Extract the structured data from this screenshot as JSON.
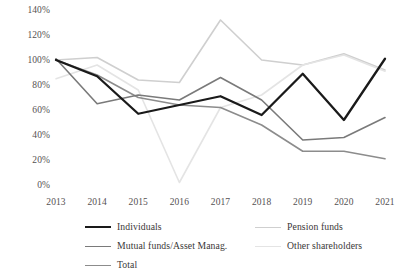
{
  "chart_data": {
    "type": "line",
    "title": "",
    "subtitle": "",
    "xlabel": "",
    "ylabel": "",
    "categories": [
      "2013",
      "2014",
      "2015",
      "2016",
      "2017",
      "2018",
      "2019",
      "2020",
      "2021"
    ],
    "ylim": [
      0,
      140
    ],
    "ytick_values": [
      0,
      20,
      40,
      60,
      80,
      100,
      120,
      140
    ],
    "ytick_labels": [
      "0%",
      "20%",
      "40%",
      "60%",
      "80%",
      "100%",
      "120%",
      "140%"
    ],
    "grid": false,
    "legend_position": "bottom",
    "series": [
      {
        "name": "Individuals",
        "color": "#1a1a1a",
        "width": 2.3,
        "values": [
          100,
          87,
          57,
          64,
          71,
          56,
          89,
          52,
          101
        ]
      },
      {
        "name": "Pension funds",
        "color": "#cfcfcf",
        "width": 1.6,
        "values": [
          100,
          102,
          84,
          82,
          132,
          100,
          96,
          105,
          92
        ]
      },
      {
        "name": "Mutual funds/Asset Manag.",
        "color": "#7a7a7a",
        "width": 1.6,
        "values": [
          101,
          65,
          72,
          68,
          86,
          68,
          36,
          38,
          54
        ]
      },
      {
        "name": "Other shareholders",
        "color": "#e4e4e4",
        "width": 1.6,
        "values": [
          85,
          96,
          76,
          2,
          62,
          72,
          96,
          104,
          91
        ]
      },
      {
        "name": "Total",
        "color": "#8c8c8c",
        "width": 1.6,
        "values": [
          100,
          88,
          70,
          64,
          62,
          48,
          27,
          27,
          21
        ]
      }
    ],
    "legend": [
      {
        "label": "Individuals",
        "color": "#1a1a1a",
        "width": 2.3,
        "col": 0,
        "row": 0
      },
      {
        "label": "Pension funds",
        "color": "#cfcfcf",
        "width": 1.6,
        "col": 1,
        "row": 0
      },
      {
        "label": "Mutual funds/Asset Manag.",
        "color": "#7a7a7a",
        "width": 1.6,
        "col": 0,
        "row": 1
      },
      {
        "label": "Other shareholders",
        "color": "#e4e4e4",
        "width": 1.6,
        "col": 1,
        "row": 1
      },
      {
        "label": "Total",
        "color": "#8c8c8c",
        "width": 1.6,
        "col": 0,
        "row": 2
      }
    ]
  }
}
